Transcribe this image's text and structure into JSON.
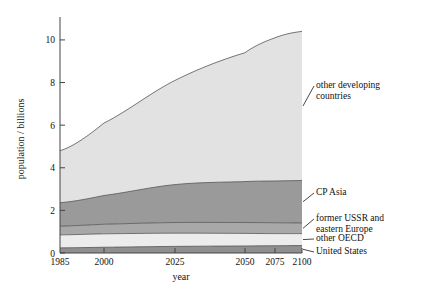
{
  "chart_data": {
    "type": "area",
    "title": "",
    "xlabel": "year",
    "ylabel": "population / billions",
    "xticklabels": [
      "1985",
      "2000",
      "2025",
      "2050",
      "2075",
      "2100"
    ],
    "xtickvalues": [
      1985,
      2000,
      2025,
      2050,
      2075,
      2100
    ],
    "yticklabels": [
      "0",
      "2",
      "4",
      "6",
      "8",
      "10"
    ],
    "ytickvalues": [
      0,
      2,
      4,
      6,
      8,
      10
    ],
    "xlim": [
      1985,
      2100
    ],
    "ylim": [
      0,
      10.7
    ],
    "grid": false,
    "legend_position": "right-inline-labels",
    "stacked": true,
    "x": [
      1985,
      2000,
      2025,
      2050,
      2075,
      2100
    ],
    "series": [
      {
        "name": "United States",
        "color": "#8f8f8f",
        "values": [
          0.24,
          0.27,
          0.31,
          0.33,
          0.34,
          0.35
        ]
      },
      {
        "name": "other OECD",
        "color": "#ececec",
        "values": [
          0.61,
          0.63,
          0.62,
          0.59,
          0.57,
          0.56
        ]
      },
      {
        "name": "former USSR and\neastern Europe",
        "color": "#a8a8a8",
        "values": [
          0.41,
          0.45,
          0.5,
          0.51,
          0.51,
          0.5
        ]
      },
      {
        "name": "CP Asia",
        "color": "#9a9a9a",
        "values": [
          1.1,
          1.35,
          1.78,
          1.92,
          1.96,
          1.99
        ]
      },
      {
        "name": "other developing\ncountries",
        "color": "#e2e2e2",
        "values": [
          2.44,
          3.4,
          4.89,
          6.05,
          6.72,
          7.0
        ]
      }
    ],
    "cumulative_tops": {
      "united_states": [
        0.24,
        0.27,
        0.31,
        0.33,
        0.34,
        0.35
      ],
      "other_oecd": [
        0.85,
        0.9,
        0.93,
        0.92,
        0.91,
        0.91
      ],
      "former_ussr_east_europe": [
        1.26,
        1.35,
        1.43,
        1.43,
        1.42,
        1.41
      ],
      "cp_asia": [
        2.36,
        2.7,
        3.21,
        3.35,
        3.38,
        3.4
      ],
      "other_developing": [
        4.8,
        6.1,
        8.1,
        9.4,
        10.1,
        10.4
      ]
    }
  },
  "legend": {
    "items": [
      {
        "key": "other_developing",
        "label": "other developing\ncountries"
      },
      {
        "key": "cp_asia",
        "label": "CP Asia"
      },
      {
        "key": "former_ussr",
        "label": "former USSR and\neastern Europe"
      },
      {
        "key": "other_oecd",
        "label": "other OECD"
      },
      {
        "key": "united_states",
        "label": "United States"
      }
    ]
  }
}
